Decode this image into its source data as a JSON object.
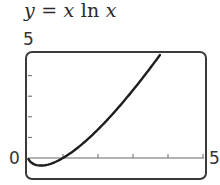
{
  "chart_data": {
    "type": "line",
    "title": "y = x ln x",
    "title_parts": {
      "y": "y",
      "eq": "=",
      "x1": "x",
      "fn": "ln",
      "x2": "x"
    },
    "xlabel": "",
    "ylabel": "",
    "xlim": [
      0,
      5
    ],
    "ylim": [
      -1,
      5
    ],
    "x_tick_labels": {
      "min": "0",
      "max": "5"
    },
    "y_tick_labels": {
      "max": "5"
    },
    "x_ticks": [
      0,
      1,
      2,
      3,
      4,
      5
    ],
    "y_ticks": [
      0,
      1,
      2,
      3,
      4,
      5
    ],
    "grid": false,
    "legend": null,
    "series": [
      {
        "name": "y = x ln x",
        "x": [
          0.01,
          0.1,
          0.2,
          0.3,
          0.368,
          0.5,
          0.75,
          1.0,
          1.25,
          1.5,
          1.75,
          2.0,
          2.25,
          2.5,
          2.75,
          3.0,
          3.25,
          3.5,
          3.77
        ],
        "y": [
          -0.05,
          -0.23,
          -0.32,
          -0.36,
          -0.37,
          -0.35,
          -0.22,
          0.0,
          0.28,
          0.61,
          0.98,
          1.39,
          1.82,
          2.29,
          2.78,
          3.3,
          3.83,
          4.38,
          5.0
        ]
      }
    ],
    "colors": {
      "curve": "#1e1e1e",
      "frame": "#3a3a3a",
      "axis": "#555555"
    }
  }
}
